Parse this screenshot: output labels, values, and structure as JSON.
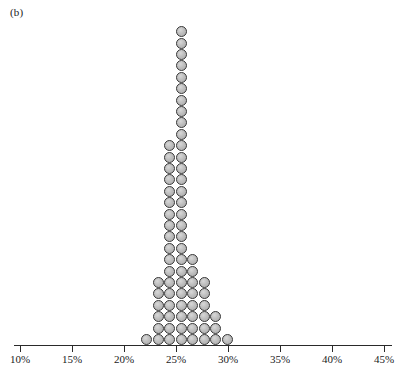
{
  "figure": {
    "panel_label": "(b)",
    "type": "dot-plot"
  },
  "chart_data": {
    "type": "bar",
    "title": "(b)",
    "xlabel": "",
    "ylabel": "",
    "xlim": [
      9.0,
      46.0
    ],
    "ylim": [
      0,
      30
    ],
    "grid": false,
    "legend": null,
    "note": "Stacked dot plot (one dot = one observation). Categories are the bin centers in percent; values are the number of stacked dots in each column.",
    "dot_value": 1,
    "dot_fill": "#b9b9b9",
    "dot_stroke": "#3a3a3a",
    "categories": [
      "22.2%",
      "23.3%",
      "24.4%",
      "25.5%",
      "26.6%",
      "27.7%",
      "28.8%",
      "29.9%"
    ],
    "values": [
      1,
      6,
      18,
      28,
      8,
      6,
      3,
      1
    ],
    "axis": {
      "ticks": [
        {
          "value": 10,
          "label": "10%"
        },
        {
          "value": 15,
          "label": "15%"
        },
        {
          "value": 20,
          "label": "20%"
        },
        {
          "value": 25,
          "label": "25%"
        },
        {
          "value": 30,
          "label": "30%"
        },
        {
          "value": 35,
          "label": "35%"
        },
        {
          "value": 40,
          "label": "40%"
        },
        {
          "value": 45,
          "label": "45%"
        }
      ],
      "min_value": 10,
      "max_value": 45,
      "min_px": 20,
      "max_px": 384,
      "baseline_px": 345
    },
    "columns": [
      {
        "center_percent": 22.2,
        "x_px": 146,
        "count": 1
      },
      {
        "center_percent": 23.3,
        "x_px": 158,
        "count": 6
      },
      {
        "center_percent": 24.4,
        "x_px": 169,
        "count": 18
      },
      {
        "center_percent": 25.5,
        "x_px": 181,
        "count": 28
      },
      {
        "center_percent": 26.6,
        "x_px": 192,
        "count": 8
      },
      {
        "center_percent": 27.7,
        "x_px": 204,
        "count": 6
      },
      {
        "center_percent": 28.8,
        "x_px": 215,
        "count": 3
      },
      {
        "center_percent": 29.9,
        "x_px": 227,
        "count": 1
      }
    ],
    "dot_geometry": {
      "diameter_px": 11,
      "row_pitch_px": 11.4,
      "col_pitch_px": 11.6
    }
  }
}
